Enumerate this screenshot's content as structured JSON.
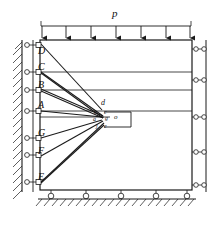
{
  "figure": {
    "type": "structural-mechanics-diagram",
    "load_label": "p",
    "stroke_color": "#1a1a1a",
    "fill_color": "#ffffff",
    "left_support_nodes": [
      {
        "id": "D",
        "label": "D",
        "x": 47,
        "y": 45
      },
      {
        "id": "C",
        "label": "C",
        "x": 47,
        "y": 72
      },
      {
        "id": "B",
        "label": "B",
        "x": 47,
        "y": 90
      },
      {
        "id": "A",
        "label": "A",
        "x": 47,
        "y": 111
      },
      {
        "id": "G",
        "label": "G",
        "x": 47,
        "y": 138
      },
      {
        "id": "F",
        "label": "F",
        "x": 47,
        "y": 155
      },
      {
        "id": "E",
        "label": "E",
        "x": 47,
        "y": 182
      }
    ],
    "left_node_labels": [
      "D",
      "C",
      "B",
      "A",
      "G",
      "F",
      "E"
    ],
    "center_labels": [
      {
        "label": "d",
        "x": 101,
        "y": 103
      },
      {
        "label": "c",
        "x": 104,
        "y": 112
      },
      {
        "label": "g",
        "x": 106,
        "y": 119
      },
      {
        "label": "o",
        "x": 116,
        "y": 118
      },
      {
        "label": "b",
        "x": 94,
        "y": 112
      },
      {
        "label": "a",
        "x": 93,
        "y": 119
      },
      {
        "label": "j",
        "x": 96,
        "y": 127
      },
      {
        "label": "e",
        "x": 104,
        "y": 127
      }
    ],
    "load_arrow_count": 7,
    "bottom_support_count": 5,
    "right_roller_count": 5,
    "horizontal_grid_lines": [
      72,
      90,
      111
    ],
    "notes": {
      "left_boundary": "hatched-fixed-wall",
      "bottom_boundary": "hatched-ground-with-rollers",
      "right_boundary": "roller-strip"
    }
  }
}
